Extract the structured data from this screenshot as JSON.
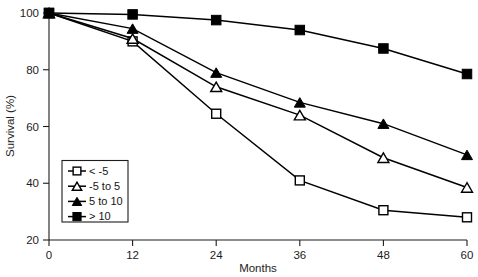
{
  "chart_data": {
    "type": "line",
    "title": "",
    "xlabel": "Months",
    "ylabel": "Survival (%)",
    "x": [
      0,
      12,
      24,
      36,
      48,
      60
    ],
    "xticklabels": [
      "0",
      "12",
      "24",
      "36",
      "48",
      "60"
    ],
    "yticklabels": [
      "20",
      "40",
      "60",
      "80",
      "100"
    ],
    "yticks": [
      20,
      40,
      60,
      80,
      100
    ],
    "xlim": [
      0,
      60
    ],
    "ylim": [
      20,
      100
    ],
    "grid": false,
    "legend_position": "lower-left-inside",
    "series": [
      {
        "name": "< -5",
        "marker": "open-square",
        "color": "#000000",
        "values": [
          100,
          90,
          64.5,
          41,
          30.5,
          28
        ]
      },
      {
        "name": "-5 to 5",
        "marker": "open-triangle",
        "color": "#000000",
        "values": [
          100,
          91,
          74,
          64,
          49,
          38.5
        ]
      },
      {
        "name": "5 to 10",
        "marker": "filled-triangle",
        "color": "#000000",
        "values": [
          100,
          94.5,
          79,
          68.5,
          61,
          50
        ]
      },
      {
        "name": "> 10",
        "marker": "filled-square",
        "color": "#000000",
        "values": [
          100,
          99.5,
          97.5,
          94,
          87.5,
          78.5
        ]
      }
    ]
  },
  "axes": {
    "x_title": "Months",
    "y_title": "Survival (%)"
  },
  "legend": {
    "items": [
      {
        "label": "< -5",
        "marker": "open-square"
      },
      {
        "label": "-5 to 5",
        "marker": "open-triangle"
      },
      {
        "label": "5 to 10",
        "marker": "filled-triangle"
      },
      {
        "label": "> 10",
        "marker": "filled-square"
      }
    ]
  },
  "colors": {
    "ink": "#1d1d1d",
    "line": "#000000",
    "background": "#ffffff"
  }
}
